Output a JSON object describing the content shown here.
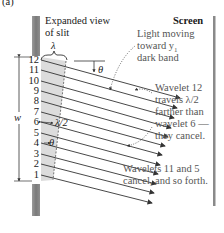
{
  "panel_label": "(a)",
  "labels": {
    "slit_title_line1": "Expanded view",
    "slit_title_line2": "of slit",
    "screen": "Screen",
    "lambda": "λ",
    "theta_top": "θ",
    "theta_small": "θ",
    "half_lambda": "λ/2",
    "width": "w",
    "light_line1": "Light moving",
    "light_line2": "toward y",
    "light_sub": "1",
    "light_line3": "dark band",
    "wavelet_line1": "Wavelet 12",
    "wavelet_line2": "travels λ/2",
    "wavelet_line3": "farther than",
    "wavelet_line4": "wavelet 6 —",
    "wavelet_line5": "they cancel.",
    "cancel_line1": "Wavelets 11 and 5",
    "cancel_line2": "cancel, and so forth."
  },
  "wavelets": [
    "12",
    "11",
    "10",
    "9",
    "8",
    "7",
    "6",
    "5",
    "4",
    "3",
    "2",
    "1"
  ],
  "colors": {
    "slit_wall": "#8a8a8a",
    "shaded_region": "#d9d9d9",
    "ray": "#333333",
    "screen": "#8a8a8a",
    "annotation_text": "#555555"
  }
}
